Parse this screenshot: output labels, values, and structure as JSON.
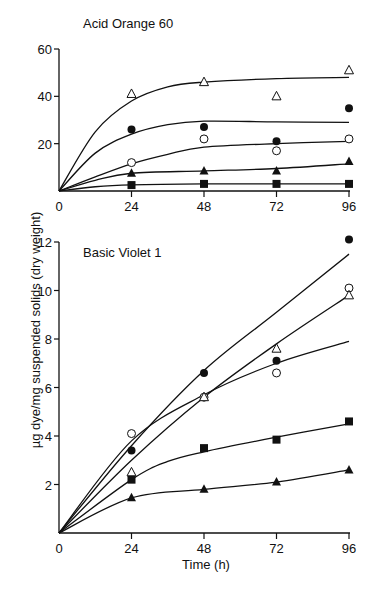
{
  "chart_data": [
    {
      "type": "scatter",
      "title": "Acid Orange 60",
      "xlabel": "Time (h)",
      "ylabel": "µg dye/mg suspended solids (dry weight)",
      "x": [
        24,
        48,
        72,
        96
      ],
      "xticks": [
        "0",
        "24",
        "48",
        "72",
        "96"
      ],
      "yticks": [
        "20",
        "40",
        "60"
      ],
      "xlim": [
        0,
        96
      ],
      "ylim": [
        0,
        60
      ],
      "grid": false,
      "legend": "none",
      "series": [
        {
          "name": "open triangle",
          "marker": "open-triangle",
          "values": [
            41,
            46,
            40,
            51
          ],
          "fit": [
            [
              0,
              0
            ],
            [
              12,
              25
            ],
            [
              24,
              38
            ],
            [
              36,
              44
            ],
            [
              48,
              46
            ],
            [
              72,
              47.5
            ],
            [
              96,
              48
            ]
          ]
        },
        {
          "name": "filled circle",
          "marker": "filled-circle",
          "values": [
            26,
            27,
            21,
            35
          ],
          "fit": [
            [
              0,
              0
            ],
            [
              12,
              16
            ],
            [
              24,
              24
            ],
            [
              36,
              28
            ],
            [
              48,
              29.5
            ],
            [
              72,
              29.2
            ],
            [
              96,
              29
            ]
          ]
        },
        {
          "name": "open circle",
          "marker": "open-circle",
          "values": [
            12,
            22,
            17,
            22
          ],
          "fit": [
            [
              0,
              0
            ],
            [
              12,
              6
            ],
            [
              24,
              11.5
            ],
            [
              36,
              15.5
            ],
            [
              48,
              18.5
            ],
            [
              72,
              20
            ],
            [
              96,
              21
            ]
          ]
        },
        {
          "name": "filled triangle",
          "marker": "filled-triangle",
          "values": [
            7.5,
            8.5,
            8.5,
            12.5
          ],
          "fit": [
            [
              0,
              0
            ],
            [
              12,
              4.5
            ],
            [
              24,
              7.5
            ],
            [
              48,
              8.5
            ],
            [
              72,
              9.5
            ],
            [
              96,
              11.5
            ]
          ]
        },
        {
          "name": "filled square",
          "marker": "filled-square",
          "values": [
            2.5,
            3,
            3,
            3
          ],
          "fit": [
            [
              0,
              0
            ],
            [
              12,
              1.8
            ],
            [
              24,
              2.6
            ],
            [
              48,
              3
            ],
            [
              72,
              3
            ],
            [
              96,
              3
            ]
          ]
        }
      ]
    },
    {
      "type": "scatter",
      "title": "Basic Violet 1",
      "xlabel": "Time (h)",
      "ylabel": "µg dye/mg suspended solids (dry weight)",
      "x": [
        24,
        48,
        72,
        96
      ],
      "xticks": [
        "0",
        "24",
        "48",
        "72",
        "96"
      ],
      "yticks": [
        "2",
        "4",
        "6",
        "8",
        "10",
        "12"
      ],
      "xlim": [
        0,
        96
      ],
      "ylim": [
        0,
        12
      ],
      "grid": false,
      "legend": "none",
      "series": [
        {
          "name": "filled circle",
          "marker": "filled-circle",
          "values": [
            3.4,
            6.6,
            7.1,
            12.1
          ],
          "fit": [
            [
              0,
              0
            ],
            [
              24,
              3.6
            ],
            [
              48,
              6.7
            ],
            [
              72,
              9.1
            ],
            [
              96,
              11.5
            ]
          ]
        },
        {
          "name": "open circle",
          "marker": "open-circle",
          "values": [
            4.1,
            5.6,
            6.6,
            10.1
          ],
          "fit": [
            [
              0,
              0
            ],
            [
              24,
              3.8
            ],
            [
              48,
              5.7
            ],
            [
              72,
              7
            ],
            [
              96,
              7.9
            ]
          ]
        },
        {
          "name": "open triangle",
          "marker": "open-triangle",
          "values": [
            2.5,
            5.6,
            7.6,
            9.8
          ],
          "fit": [
            [
              0,
              0
            ],
            [
              24,
              3
            ],
            [
              48,
              5.6
            ],
            [
              72,
              7.8
            ],
            [
              96,
              9.8
            ]
          ]
        },
        {
          "name": "filled square",
          "marker": "filled-square",
          "values": [
            2.2,
            3.5,
            3.85,
            4.6
          ],
          "fit": [
            [
              0,
              0
            ],
            [
              24,
              2.2
            ],
            [
              36,
              2.95
            ],
            [
              48,
              3.35
            ],
            [
              72,
              3.95
            ],
            [
              96,
              4.5
            ]
          ]
        },
        {
          "name": "filled triangle",
          "marker": "filled-triangle",
          "values": [
            1.45,
            1.8,
            2.1,
            2.6
          ],
          "fit": [
            [
              0,
              0
            ],
            [
              24,
              1.45
            ],
            [
              48,
              1.8
            ],
            [
              72,
              2.1
            ],
            [
              96,
              2.6
            ]
          ]
        }
      ]
    }
  ],
  "labels": {
    "top_title": "Acid Orange 60",
    "bottom_title": "Basic Violet 1",
    "ylabel": "µg dye/mg suspended solids (dry weight)",
    "xlabel": "Time (h)",
    "top_xticks": [
      "0",
      "24",
      "48",
      "72",
      "96"
    ],
    "top_yticks": [
      "20",
      "40",
      "60"
    ],
    "bottom_xticks": [
      "0",
      "24",
      "48",
      "72",
      "96"
    ],
    "bottom_yticks": [
      "2",
      "4",
      "6",
      "8",
      "10",
      "12"
    ]
  }
}
